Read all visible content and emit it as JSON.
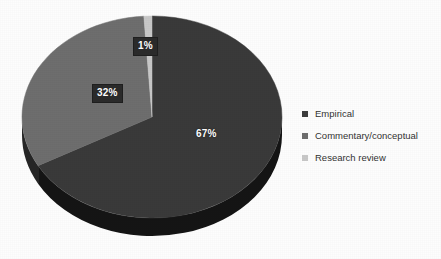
{
  "chart_data": {
    "type": "pie",
    "title": "",
    "subtitle": "",
    "xlabel": "",
    "ylabel": "",
    "grid": false,
    "three_d": true,
    "legend_position": "right",
    "start_angle_deg": 0,
    "direction": "clockwise",
    "categories": [
      "Empirical",
      "Commentary/conceptual",
      "Research review"
    ],
    "values": [
      67,
      32,
      1
    ],
    "data_labels": [
      "67%",
      "32%",
      "1%"
    ],
    "colors": [
      "#3a3a3a",
      "#6e6e6e",
      "#c8c8c8"
    ],
    "slices": [
      {
        "label": "Empirical",
        "value": 67,
        "data_label": "67%",
        "color": "#3a3a3a",
        "side_color": "#151515",
        "label_boxed": false
      },
      {
        "label": "Commentary/conceptual",
        "value": 32,
        "data_label": "32%",
        "color": "#6e6e6e",
        "side_color": "#262626",
        "label_boxed": true
      },
      {
        "label": "Research review",
        "value": 1,
        "data_label": "1%",
        "color": "#c8c8c8",
        "side_color": "#3d3d3d",
        "label_boxed": true
      }
    ]
  },
  "legend": {
    "items": [
      {
        "label": "Empirical",
        "color": "#3d3d3d"
      },
      {
        "label": "Commentary/conceptual",
        "color": "#6e6e6e"
      },
      {
        "label": "Research review",
        "color": "#c8c8c8"
      }
    ]
  },
  "palette": {
    "background": "#fdfdfd",
    "label_box": "#2b2b2b",
    "label_text": "#ffffff",
    "legend_text": "#333333"
  }
}
